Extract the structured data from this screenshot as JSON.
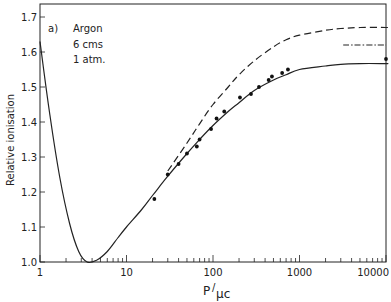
{
  "chart_data": {
    "type": "line",
    "panel_label": "a)",
    "annotation": [
      "Argon",
      "6 cms",
      "1 atm."
    ],
    "xlabel": "P/µc",
    "ylabel": "Relative ionisation",
    "xscale": "log",
    "xlim": [
      1,
      10000
    ],
    "ylim": [
      1.0,
      1.74
    ],
    "x_ticks": [
      1,
      10,
      100,
      1000,
      10000
    ],
    "x_tick_labels": [
      "1",
      "10",
      "100",
      "1000",
      "10000"
    ],
    "y_ticks": [
      1.0,
      1.1,
      1.2,
      1.3,
      1.4,
      1.5,
      1.6,
      1.7
    ],
    "y_tick_labels": [
      "1.0",
      "1.1",
      "1.2",
      "1.3",
      "1.4",
      "1.5",
      "1.6",
      "1.7"
    ],
    "grid": false,
    "series": [
      {
        "name": "theory (solid)",
        "style": "solid",
        "x": [
          1,
          1.3,
          1.7,
          2.2,
          2.8,
          3.5,
          4.5,
          6,
          8,
          10,
          15,
          20,
          30,
          50,
          70,
          100,
          150,
          200,
          300,
          500,
          700,
          1000,
          2000,
          3000,
          5000,
          10000,
          14000
        ],
        "y": [
          1.63,
          1.42,
          1.24,
          1.11,
          1.03,
          1.0,
          1.005,
          1.03,
          1.07,
          1.1,
          1.15,
          1.19,
          1.245,
          1.31,
          1.35,
          1.39,
          1.43,
          1.455,
          1.49,
          1.52,
          1.535,
          1.55,
          1.56,
          1.565,
          1.567,
          1.567,
          1.567
        ]
      },
      {
        "name": "theory (dashed)",
        "style": "dashed",
        "x": [
          30,
          50,
          70,
          100,
          150,
          200,
          300,
          500,
          700,
          1000,
          2000,
          3000,
          5000,
          10000,
          14000
        ],
        "y": [
          1.26,
          1.34,
          1.395,
          1.45,
          1.5,
          1.535,
          1.575,
          1.615,
          1.635,
          1.648,
          1.662,
          1.667,
          1.67,
          1.67,
          1.67
        ]
      },
      {
        "name": "theory (dash-dot)",
        "style": "dashdot",
        "x": [
          3200,
          14000
        ],
        "y": [
          1.62,
          1.62
        ]
      },
      {
        "name": "measured",
        "style": "points",
        "x": [
          21,
          30,
          40,
          50,
          65,
          70,
          95,
          110,
          135,
          205,
          275,
          340,
          440,
          480,
          630,
          735,
          14000
        ],
        "y": [
          1.18,
          1.25,
          1.28,
          1.31,
          1.33,
          1.35,
          1.38,
          1.41,
          1.43,
          1.47,
          1.48,
          1.5,
          1.52,
          1.53,
          1.54,
          1.55,
          1.58
        ]
      }
    ]
  }
}
